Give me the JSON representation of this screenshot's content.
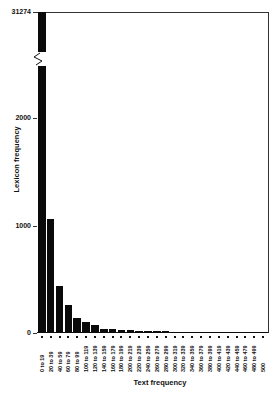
{
  "chart_data": {
    "type": "bar",
    "title": "",
    "xlabel": "Text frequency",
    "ylabel": "Lexicon frequency",
    "y_ticks": [
      "0",
      "1000",
      "2000",
      "31274"
    ],
    "y_axis_break": true,
    "ylim": [
      0,
      31274
    ],
    "grid": false,
    "legend": null,
    "categories": [
      "0 to 19",
      "20 to 39",
      "40 to 59",
      "60 to 79",
      "80 to 99",
      "100 to 119",
      "120 to 139",
      "140 to 159",
      "160 to 179",
      "180 to 199",
      "200 to 219",
      "220 to 239",
      "240 to 259",
      "260 to 279",
      "280 to 299",
      "300 to 319",
      "320 to 339",
      "340 to 359",
      "360 to 379",
      "380 to 399",
      "400 to 419",
      "420 to 439",
      "440 to 459",
      "460 to 479",
      "480 to 499",
      "500"
    ],
    "values": [
      31274,
      1060,
      435,
      260,
      140,
      100,
      75,
      40,
      40,
      30,
      25,
      20,
      18,
      18,
      15,
      12,
      10,
      10,
      8,
      8,
      7,
      6,
      6,
      5,
      5,
      10
    ]
  }
}
